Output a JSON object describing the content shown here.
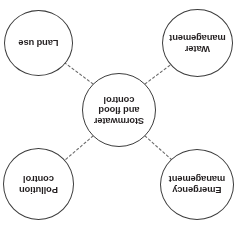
{
  "diagram": {
    "type": "hub-and-spoke",
    "orientation_note": "rendered upside-down (180 degrees)",
    "colors": {
      "background": "#ffffff",
      "node_outline": "#3b3b3b",
      "text": "#231f20",
      "connector": "#6b6b6b"
    },
    "center": {
      "id": "stormwater-and-flood-control",
      "label": "Stormwater and flood control",
      "lines": [
        "Stormwater",
        "and",
        "flood control"
      ]
    },
    "satellites": [
      {
        "id": "emergency-management",
        "label": "Emergency management",
        "lines": [
          "Emergency",
          "management"
        ],
        "position": "top-left"
      },
      {
        "id": "pollution-control",
        "label": "Pollution control",
        "lines": [
          "Pollution",
          "control"
        ],
        "position": "top-right"
      },
      {
        "id": "water-management",
        "label": "Water management",
        "lines": [
          "Water",
          "management"
        ],
        "position": "bottom-left"
      },
      {
        "id": "land-use",
        "label": "Land use",
        "lines": [
          "Land",
          "use"
        ],
        "position": "bottom-right"
      }
    ],
    "connectors": [
      {
        "from": "stormwater-and-flood-control",
        "to": "emergency-management",
        "style": "dashed"
      },
      {
        "from": "stormwater-and-flood-control",
        "to": "pollution-control",
        "style": "dashed"
      },
      {
        "from": "stormwater-and-flood-control",
        "to": "water-management",
        "style": "dashed"
      },
      {
        "from": "stormwater-and-flood-control",
        "to": "land-use",
        "style": "dashed"
      }
    ]
  }
}
